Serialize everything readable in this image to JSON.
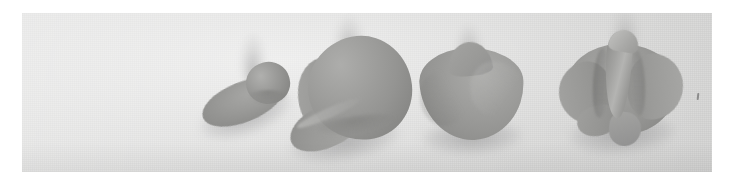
{
  "image": {
    "kind": "photograph",
    "subject": "row of four gray three-dimensional specimen forms on a light textured background",
    "specimen_count": 4,
    "orientation": "landscape",
    "width_px": 729,
    "height_px": 186
  },
  "panel": {
    "x_px": 22,
    "y_px": 13,
    "width_px": 690,
    "height_px": 159,
    "background_color": "#dededd",
    "texture": "fine woven canvas / paper grain",
    "lighting": "soft diffuse from upper left"
  },
  "palette": {
    "page_background": "#ffffff",
    "panel_background": "#dededd",
    "specimen_midtone": "#9a9a98",
    "specimen_highlight": "#b4b4b2",
    "specimen_shadow": "#7e7e7c",
    "contact_shadow": "rgba(110,110,112,0.42)"
  },
  "specimens": [
    {
      "index": 1,
      "label": "specimen-1",
      "description": "small ovoid body with flat elliptical flange sweeping to the lower left",
      "complexity": "simple",
      "x_px": 196,
      "y_px": 38,
      "width_px": 120,
      "height_px": 100,
      "parts": [
        "ovoid",
        "flange",
        "contact-shadow",
        "wisp"
      ]
    },
    {
      "index": 2,
      "label": "specimen-2",
      "description": "large rounded spheroid body with a conical beak projecting from the lower left",
      "complexity": "moderate",
      "x_px": 282,
      "y_px": 30,
      "width_px": 160,
      "height_px": 130,
      "parts": [
        "sphere",
        "left-lobe",
        "beak",
        "seam",
        "contact-shadow",
        "wisp"
      ]
    },
    {
      "index": 3,
      "label": "specimen-3",
      "description": "rounded rhombus or peaked lump with a lighter facet on the right flank",
      "complexity": "moderate",
      "x_px": 408,
      "y_px": 40,
      "width_px": 130,
      "height_px": 110,
      "parts": [
        "rhombus-mass",
        "peak",
        "right-facet",
        "left-facet",
        "contact-shadow",
        "wisp"
      ]
    },
    {
      "index": 4,
      "label": "specimen-4",
      "description": "crumpled multi-folded form with a vertical central ridge, flanking lobes and lower tabs",
      "complexity": "complex",
      "x_px": 553,
      "y_px": 28,
      "width_px": 140,
      "height_px": 128,
      "parts": [
        "mass",
        "left-lobe",
        "right-lobe",
        "central-ridge",
        "crest",
        "fold-a",
        "fold-b",
        "lower-left-tab",
        "lower-center-tab",
        "contact-shadow",
        "wisp"
      ]
    }
  ],
  "artifacts": [
    {
      "name": "dust-speck",
      "x_px": 697,
      "y_px": 93,
      "description": "small dark fleck on the background near the right edge"
    }
  ]
}
